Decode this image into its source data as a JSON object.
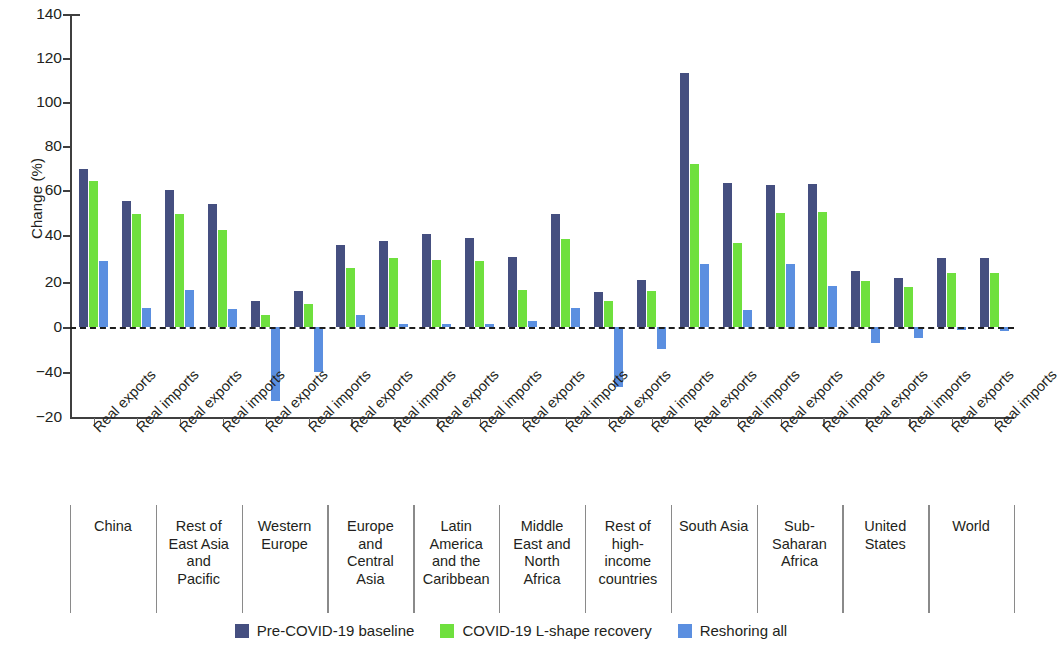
{
  "chart_data": {
    "type": "bar",
    "title": "",
    "xlabel": "",
    "ylabel": "Change (%)",
    "ylim": [
      -20,
      140
    ],
    "grid": false,
    "legend_position": "bottom-center",
    "y_ticks": [
      "140",
      "120",
      "100",
      "80",
      "60",
      "40",
      "20",
      "0",
      "−40",
      "−20"
    ],
    "y_tick_values": [
      140,
      120,
      100,
      80,
      60,
      40,
      20,
      0,
      -40,
      -20
    ],
    "zero_reference_line": true,
    "measures": [
      "Real exports",
      "Real imports"
    ],
    "legend": [
      {
        "name": "Pre-COVID-19 baseline",
        "color": "#454f80"
      },
      {
        "name": "COVID-19 L-shape recovery",
        "color": "#6fe03e"
      },
      {
        "name": "Reshoring all",
        "color": "#5b8fe0"
      }
    ],
    "series": [
      {
        "name": "Pre-COVID-19 baseline",
        "color": "#454f80",
        "values": [
          70.5,
          56.5,
          61.5,
          55,
          11.5,
          16,
          36.5,
          38.5,
          41.5,
          40,
          31.5,
          50.5,
          15.5,
          21,
          113.5,
          64.5,
          63.5,
          64,
          25,
          22,
          31,
          31
        ]
      },
      {
        "name": "COVID-19 L-shape recovery",
        "color": "#6fe03e",
        "values": [
          65.5,
          50.5,
          50.5,
          43.5,
          5.5,
          10.5,
          26.5,
          31,
          30,
          29.5,
          16.5,
          39.5,
          11.5,
          16,
          73,
          37.5,
          51,
          51.5,
          20.5,
          18,
          24,
          24
        ]
      },
      {
        "name": "Reshoring all",
        "color": "#5b8fe0",
        "values": [
          29.5,
          8.5,
          16.5,
          8,
          -33,
          -20,
          5.5,
          1.5,
          1.5,
          1.5,
          2.5,
          8.5,
          -27,
          -10,
          28,
          7.5,
          28,
          18.5,
          -7,
          -5,
          -1.5,
          -2
        ]
      }
    ],
    "groups": [
      {
        "label": "China",
        "lines": [
          "China"
        ],
        "categories": [
          "Real exports",
          "Real imports"
        ]
      },
      {
        "label": "Rest of East Asia and Pacific",
        "lines": [
          "Rest of",
          "East Asia",
          "and",
          "Pacific"
        ],
        "categories": [
          "Real exports",
          "Real imports"
        ]
      },
      {
        "label": "Western Europe",
        "lines": [
          "Western",
          "Europe"
        ],
        "categories": [
          "Real exports",
          "Real imports"
        ]
      },
      {
        "label": "Europe and Central Asia",
        "lines": [
          "Europe",
          "and",
          "Central",
          "Asia"
        ],
        "categories": [
          "Real exports",
          "Real imports"
        ]
      },
      {
        "label": "Latin America and the Caribbean",
        "lines": [
          "Latin",
          "America",
          "and the",
          "Caribbean"
        ],
        "categories": [
          "Real exports",
          "Real imports"
        ]
      },
      {
        "label": "Middle East and North Africa",
        "lines": [
          "Middle",
          "East and",
          "North",
          "Africa"
        ],
        "categories": [
          "Real exports",
          "Real imports"
        ]
      },
      {
        "label": "Rest of high-income countries",
        "lines": [
          "Rest of",
          "high-",
          "income",
          "countries"
        ],
        "categories": [
          "Real exports",
          "Real imports"
        ]
      },
      {
        "label": "South Asia",
        "lines": [
          "South Asia"
        ],
        "categories": [
          "Real exports",
          "Real imports"
        ]
      },
      {
        "label": "Sub-Saharan Africa",
        "lines": [
          "Sub-",
          "Saharan",
          "Africa"
        ],
        "categories": [
          "Real exports",
          "Real imports"
        ]
      },
      {
        "label": "United States",
        "lines": [
          "United",
          "States"
        ],
        "categories": [
          "Real exports",
          "Real imports"
        ]
      },
      {
        "label": "World",
        "lines": [
          "World"
        ],
        "categories": [
          "Real exports",
          "Real imports"
        ]
      }
    ]
  }
}
